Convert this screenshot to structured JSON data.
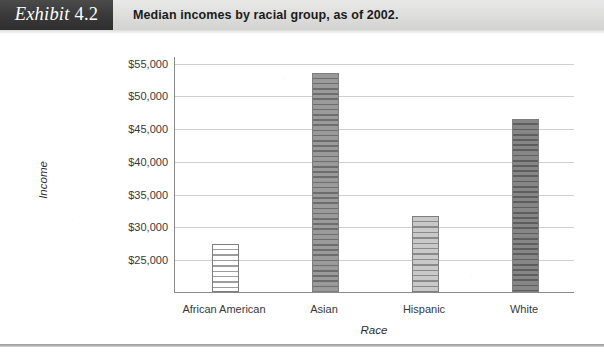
{
  "header": {
    "exhibit_word": "Exhibit",
    "exhibit_number": "4.2",
    "title": "Median incomes by racial group, as of 2002."
  },
  "chart_data": {
    "type": "bar",
    "title": "Median incomes by racial group, as of 2002.",
    "xlabel": "Race",
    "ylabel": "Income",
    "categories": [
      "African American",
      "Asian",
      "Hispanic",
      "White"
    ],
    "values": [
      27300,
      53400,
      31600,
      46400
    ],
    "ylim": [
      20000,
      56000
    ],
    "ytick_labels": [
      "$55,000",
      "$50,000",
      "$45,000",
      "$40,000",
      "$35,000",
      "$30,000",
      "$25,000"
    ],
    "ytick_values": [
      55000,
      50000,
      45000,
      40000,
      35000,
      30000,
      25000
    ],
    "grid": true,
    "legend": "none",
    "bar_styles": [
      "light",
      "dark",
      "mid",
      "darker"
    ],
    "colors": {
      "bar_light": "#ffffff",
      "bar_mid": "#c9c9c9",
      "bar_dark": "#9a9a9a",
      "bar_darker": "#868686",
      "bar_outline": "#7e7e7e",
      "gridline": "#cfcfcf",
      "axis": "#8b8b8b",
      "header_tag_bg": "#3b3b3b",
      "header_bar_bg": "#dededd",
      "text": "#383838"
    }
  }
}
